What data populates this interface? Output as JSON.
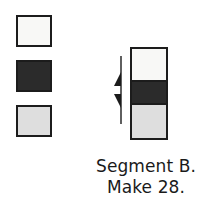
{
  "diagram": {
    "swatches": {
      "label": "fabric swatch set",
      "items": [
        {
          "name": "swatch-white",
          "fill": "#f8f8f6",
          "tone": "white",
          "order": 1
        },
        {
          "name": "swatch-dark",
          "fill": "#2b2b2b",
          "tone": "dark",
          "order": 2
        },
        {
          "name": "swatch-gray",
          "fill": "#dedede",
          "tone": "light gray",
          "order": 3
        }
      ]
    },
    "strip_unit": {
      "label": "assembled strip unit",
      "segments": [
        {
          "name": "strip-segment-top",
          "fill": "#f8f8f6",
          "tone": "white"
        },
        {
          "name": "strip-segment-middle",
          "fill": "#2b2b2b",
          "tone": "dark"
        },
        {
          "name": "strip-segment-bottom",
          "fill": "#dedede",
          "tone": "light gray"
        }
      ]
    },
    "dimension_marker": {
      "name": "height-dimension-arrows",
      "description": "double arrow marking the middle dark segment height",
      "color": "#1c1c1c"
    },
    "caption": {
      "line1": "Segment B.",
      "line2": "Make 28."
    }
  },
  "colors": {
    "outline": "#1c1c1c",
    "white_fabric": "#f8f8f6",
    "dark_fabric": "#2b2b2b",
    "gray_fabric": "#dedede",
    "text": "#1a1a1a",
    "background": "#ffffff"
  }
}
